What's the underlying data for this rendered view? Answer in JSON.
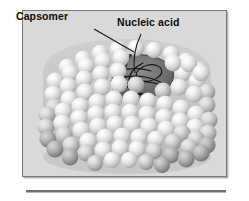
{
  "figure": {
    "panel_background": "#d9d9d9",
    "border_color": "#7a7a7a",
    "labels": [
      {
        "id": "capsomer",
        "text": "Capsomer",
        "leader": "diagonal line from label down-right to a capsomer sphere on the top rim"
      },
      {
        "id": "nucleic-acid",
        "text": "Nucleic acid",
        "leader": "line from label curving down-left into the dark cutaway opening"
      }
    ],
    "structure": {
      "shape": "barrel / helical cylinder seen at an angle",
      "subunit_name": "capsomer",
      "subunit_color": "#e8e8e8",
      "subunit_shadow_color": "#9a9a9a",
      "cutaway_color": "#6a6a6a",
      "core_label": "Nucleic acid",
      "core_strand_color": "#1c1c1c",
      "row_count": 13,
      "rows_per_turn": "helical diagonal rows of spherical capsomers"
    },
    "caption_rule": {
      "present": true,
      "color": "#6f6f6f"
    }
  }
}
